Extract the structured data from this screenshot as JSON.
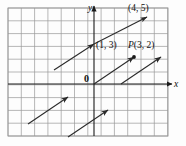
{
  "figure": {
    "type": "vector-diagram",
    "background_color": "#fdfdfd",
    "grid": {
      "line_color": "#9a9a9a",
      "cell_size_px": 13.3,
      "left_px": 8,
      "top_px": 8,
      "right_px": 168,
      "bottom_px": 136,
      "columns": 12,
      "rows": 10,
      "visible": true
    },
    "axes": {
      "color": "#1a1a1a",
      "x_axis": {
        "label": "x",
        "y_px": 84,
        "from_px": 8,
        "to_px": 172,
        "arrow": "right"
      },
      "y_axis": {
        "label": "y",
        "x_px": 94,
        "from_px": 136,
        "to_px": 6,
        "arrow": "up"
      },
      "origin_label": "0"
    },
    "vectors": [
      {
        "name": "vector-top",
        "tail_px": {
          "x": 54,
          "y": 70
        },
        "head_px": {
          "x": 94,
          "y": 44
        },
        "color": "#2b2b2b"
      },
      {
        "name": "vector-middle-upper",
        "tail_px": {
          "x": 94,
          "y": 44
        },
        "head_px": {
          "x": 147,
          "y": 17
        },
        "color": "#2b2b2b"
      },
      {
        "name": "vector-through-p",
        "tail_px": {
          "x": 94,
          "y": 84
        },
        "head_px": {
          "x": 134,
          "y": 57
        },
        "color": "#2b2b2b"
      },
      {
        "name": "vector-lower-left",
        "tail_px": {
          "x": 28,
          "y": 124
        },
        "head_px": {
          "x": 68,
          "y": 97
        },
        "color": "#2b2b2b"
      },
      {
        "name": "vector-lower-middle",
        "tail_px": {
          "x": 68,
          "y": 137
        },
        "head_px": {
          "x": 108,
          "y": 110
        },
        "color": "#2b2b2b"
      },
      {
        "name": "vector-lower-right",
        "tail_px": {
          "x": 121,
          "y": 84
        },
        "head_px": {
          "x": 161,
          "y": 57
        },
        "color": "#2b2b2b"
      }
    ],
    "points": [
      {
        "name": "point-4-5",
        "label": "(4, 5)",
        "label_px": {
          "x": 128,
          "y": 6
        },
        "dot_px": {
          "x": 147,
          "y": 17
        },
        "dot_visible": false
      },
      {
        "name": "point-1-3",
        "label": "(1, 3)",
        "label_px": {
          "x": 97,
          "y": 44
        },
        "dot_px": {
          "x": 94,
          "y": 44
        },
        "dot_visible": false
      },
      {
        "name": "point-p-3-2",
        "label_prefix": "P",
        "label": "(3, 2)",
        "label_px": {
          "x": 131,
          "y": 44
        },
        "dot_px": {
          "x": 134,
          "y": 57
        },
        "dot_visible": true
      }
    ],
    "origin": {
      "label": "0",
      "label_px": {
        "x": 84,
        "y": 74
      }
    }
  }
}
